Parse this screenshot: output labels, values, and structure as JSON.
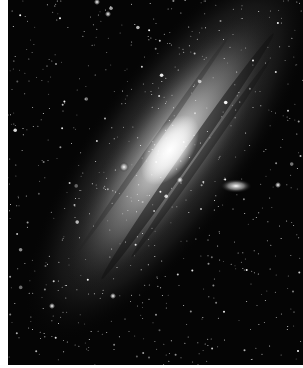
{
  "image": {
    "subject": "Andromeda galaxy (M31) with satellite galaxies",
    "colors": {
      "background": "#050505",
      "border": "#ffffff",
      "core": "#ffffff",
      "disk": "#9a9a9a",
      "dust_lane": "#1a1a1a"
    },
    "elements": {
      "core": {
        "cx": 170,
        "cy": 145
      },
      "satellite_elliptical": {
        "cx": 236,
        "cy": 186
      },
      "satellite_compact": {
        "cx": 124,
        "cy": 167
      }
    }
  }
}
